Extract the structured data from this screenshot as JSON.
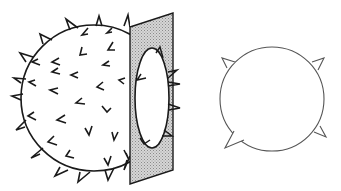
{
  "diagram": {
    "colors": {
      "background": "#ffffff",
      "stroke": "#1a1a1a",
      "plate_fill": "#c8c8c8",
      "section_stroke": "#555555"
    },
    "sphere": {
      "cx": 94,
      "cy": 98,
      "r": 73
    },
    "plate": {
      "points": "130,27 173,13 173,170 130,184"
    },
    "hole": {
      "cx": 150,
      "cy": 98,
      "rx": 17,
      "ry": 50
    },
    "cross_section": {
      "cx": 272,
      "cy": 99,
      "r": 52,
      "spike_count": 4
    }
  }
}
